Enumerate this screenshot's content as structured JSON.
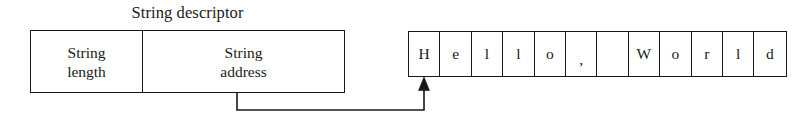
{
  "diagram": {
    "title": "String descriptor",
    "descriptor": {
      "fields": [
        {
          "name": "string-length",
          "line1": "String",
          "line2": "length"
        },
        {
          "name": "string-address",
          "line1": "String",
          "line2": "address"
        }
      ]
    },
    "string_buffer": {
      "text": "Hello, World",
      "cells": [
        {
          "char": "H"
        },
        {
          "char": "e"
        },
        {
          "char": "l"
        },
        {
          "char": "l"
        },
        {
          "char": "o"
        },
        {
          "char": ","
        },
        {
          "char": " "
        },
        {
          "char": "W"
        },
        {
          "char": "o"
        },
        {
          "char": "r"
        },
        {
          "char": "l"
        },
        {
          "char": "d"
        }
      ]
    },
    "pointer": {
      "label": "string-address-pointer",
      "from_field": "String address",
      "to_cell_index": 0
    },
    "colors": {
      "background": "#ffffff",
      "stroke": "#181818",
      "text": "#1a1a1a"
    }
  }
}
